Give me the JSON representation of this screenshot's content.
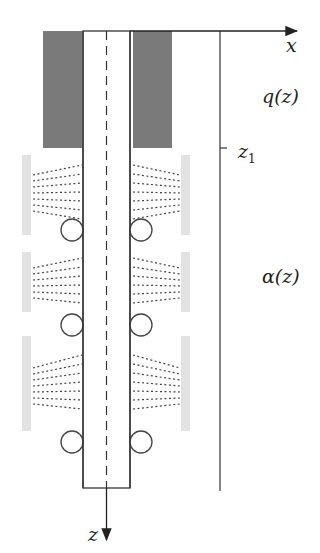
{
  "diagram": {
    "labels": {
      "x_axis": "x",
      "z_axis": "z",
      "heat_flux": "q(z)",
      "z1_main": "z",
      "z1_sub": "1",
      "heat_transfer_coeff": "α(z)"
    },
    "colors": {
      "line": "#333333",
      "mould_block": "#7a7a7a",
      "spray_header": "#e2e2e2",
      "spray_dots": "#444444",
      "background": "#ffffff"
    },
    "components": {
      "mould_blocks": 2,
      "spray_zones": 3,
      "support_roll_pairs": 3
    }
  }
}
